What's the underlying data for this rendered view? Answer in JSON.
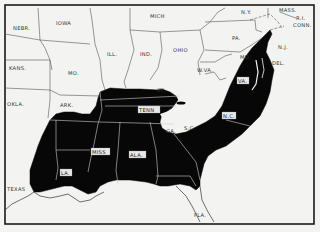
{
  "map": {
    "type": "choropleth-region",
    "description_shading": "black",
    "colors": {
      "shaded": "#070707",
      "background": "#f3f3f1",
      "border": "#1a1a1a"
    },
    "labels": {
      "nebr": "NEBR.",
      "iowa": "IOWA",
      "mich": "MICH",
      "ny": "N.Y.",
      "mass": "MASS.",
      "conn": "CONN.",
      "ri": "R.I.",
      "kans": "KANS.",
      "mo": "MO.",
      "ill": "ILL.",
      "ind": "IND.",
      "ohio": "OHIO",
      "pa": "PA.",
      "nj": "N.J.",
      "del": "DEL.",
      "md": "MD.",
      "wva": "W.VA.",
      "va": "VA.",
      "ky": "KY.",
      "okla": "OKLA.",
      "ark": "ARK.",
      "tenn": "TENN",
      "nc": "N.C.",
      "ga": "GA.",
      "sc": "S.C.",
      "miss": "MISS",
      "ala": "ALA.",
      "la": "LA.",
      "texas": "TEXAS",
      "fla": "FLA."
    }
  }
}
